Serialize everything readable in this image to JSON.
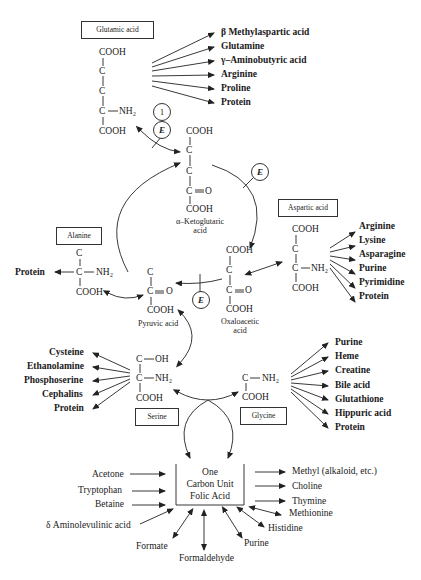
{
  "glutamic": {
    "label": "Glutamic acid",
    "structure": [
      "COOH",
      "C",
      "C",
      "C",
      "NH₂",
      "COOH"
    ],
    "products": [
      "β Methylaspartic acid",
      "Glutamine",
      "γ–Aminobutyric acid",
      "Arginine",
      "Proline",
      "Protein"
    ]
  },
  "markers": {
    "step_number": "1",
    "enzyme": "E"
  },
  "ketoglutaric": {
    "structure": [
      "COOH",
      "C",
      "C",
      "C",
      "O",
      "COOH"
    ],
    "name_line1": "α–Ketoglutaric",
    "name_line2": "acid"
  },
  "alanine": {
    "label": "Alanine",
    "structure": [
      "C",
      "C",
      "NH₂",
      "COOH"
    ],
    "products": [
      "Protein"
    ]
  },
  "pyruvic": {
    "structure": [
      "C",
      "C",
      "O",
      "COOH"
    ],
    "name": "Pyruvic acid"
  },
  "oxaloacetic": {
    "structure": [
      "COOH",
      "C",
      "C",
      "O",
      "COOH"
    ],
    "name_line1": "Oxaloacetic",
    "name_line2": "acid"
  },
  "aspartic": {
    "label": "Aspartic acid",
    "structure": [
      "COOH",
      "C",
      "C",
      "NH₂",
      "COOH"
    ],
    "products": [
      "Arginine",
      "Lysine",
      "Asparagine",
      "Purine",
      "Pyrimidine",
      "Protein"
    ]
  },
  "serine": {
    "label": "Serine",
    "structure": [
      "C",
      "OH",
      "C",
      "NH₂",
      "COOH"
    ],
    "products": [
      "Cysteine",
      "Ethanolamine",
      "Phosphoserine",
      "Cephalins",
      "Protein"
    ]
  },
  "glycine": {
    "label": "Glycine",
    "structure": [
      "C",
      "NH₂",
      "COOH"
    ],
    "products": [
      "Purine",
      "Heme",
      "Creatine",
      "Bile acid",
      "Glutathione",
      "Hippuric acid",
      "Protein"
    ]
  },
  "one_carbon": {
    "lines": [
      "One",
      "Carbon Unit",
      "Folic Acid"
    ],
    "inputs": [
      "Acetone",
      "Tryptophan",
      "Betaine",
      "δ Aminolevulinic acid"
    ],
    "outputs": [
      "Methyl (alkaloid, etc.)",
      "Choline",
      "Thymine"
    ],
    "bidirectional": [
      "Methionine",
      "Histidine",
      "Purine",
      "Formaldehyde",
      "Formate"
    ]
  }
}
